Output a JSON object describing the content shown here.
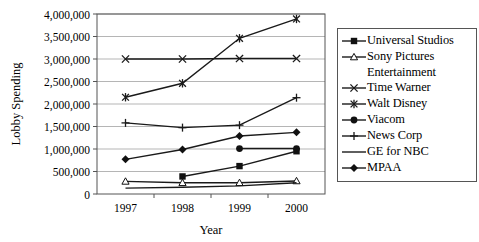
{
  "chart_data": {
    "type": "line",
    "title": "",
    "xlabel": "Year",
    "ylabel": "Lobby Spending",
    "x": [
      1997,
      1998,
      1999,
      2000
    ],
    "xticklabels": [
      "1997",
      "1998",
      "1999",
      "2000"
    ],
    "ylim": [
      0,
      4000000
    ],
    "yticks": [
      0,
      500000,
      1000000,
      1500000,
      2000000,
      2500000,
      3000000,
      3500000,
      4000000
    ],
    "yticklabels": [
      "0",
      "500,000",
      "1,000,000",
      "1,500,000",
      "2,000,000",
      "2,500,000",
      "3,000,000",
      "3,500,000",
      "4,000,000"
    ],
    "grid": "horizontal",
    "legend_position": "right",
    "series": [
      {
        "name": "Universal Studios",
        "marker": "filled-square",
        "values": [
          null,
          390000,
          620000,
          950000
        ]
      },
      {
        "name": "Sony Pictures Entertainment",
        "marker": "open-triangle",
        "values": [
          280000,
          250000,
          250000,
          290000
        ]
      },
      {
        "name": "Time Warner",
        "marker": "cross-x",
        "values": [
          3000000,
          3000000,
          3010000,
          3010000
        ]
      },
      {
        "name": "Walt Disney",
        "marker": "asterisk",
        "values": [
          2150000,
          2460000,
          3460000,
          3890000
        ]
      },
      {
        "name": "Viacom",
        "marker": "filled-circle",
        "values": [
          null,
          null,
          1010000,
          1010000
        ]
      },
      {
        "name": "News Corp",
        "marker": "plus",
        "values": [
          1580000,
          1475000,
          1530000,
          2140000
        ]
      },
      {
        "name": "GE for NBC",
        "marker": "none",
        "values": [
          130000,
          150000,
          180000,
          250000
        ]
      },
      {
        "name": "MPAA",
        "marker": "filled-diamond",
        "values": [
          770000,
          990000,
          1290000,
          1370000
        ]
      }
    ],
    "colors": {
      "line": "#1a1a1a",
      "grid": "#b5b5b5",
      "axis": "#555555",
      "background": "#ffffff"
    }
  },
  "legend": {
    "entries": [
      {
        "label": "Universal Studios",
        "marker": "filled-square"
      },
      {
        "label": "Sony Pictures",
        "label_cont": "Entertainment",
        "marker": "open-triangle"
      },
      {
        "label": "Time Warner",
        "marker": "cross-x"
      },
      {
        "label": "Walt Disney",
        "marker": "asterisk"
      },
      {
        "label": "Viacom",
        "marker": "filled-circle"
      },
      {
        "label": "News Corp",
        "marker": "plus"
      },
      {
        "label": "GE for NBC",
        "marker": "none"
      },
      {
        "label": "MPAA",
        "marker": "filled-diamond"
      }
    ]
  }
}
